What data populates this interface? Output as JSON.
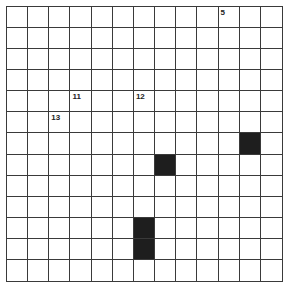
{
  "puzzle": {
    "type": "crossword",
    "rows": 13,
    "cols": 13,
    "colors": {
      "grid_line": "#3a3a3a",
      "black_cell": "#1e1e1e",
      "white_cell": "#ffffff"
    },
    "black_cells": [
      {
        "row": 6,
        "col": 11
      },
      {
        "row": 7,
        "col": 7
      },
      {
        "row": 10,
        "col": 6
      },
      {
        "row": 11,
        "col": 6
      }
    ],
    "clue_numbers": [
      {
        "row": 0,
        "col": 10,
        "label": "5"
      },
      {
        "row": 4,
        "col": 3,
        "label": "11"
      },
      {
        "row": 4,
        "col": 6,
        "label": "12"
      },
      {
        "row": 5,
        "col": 2,
        "label": "13"
      }
    ]
  }
}
